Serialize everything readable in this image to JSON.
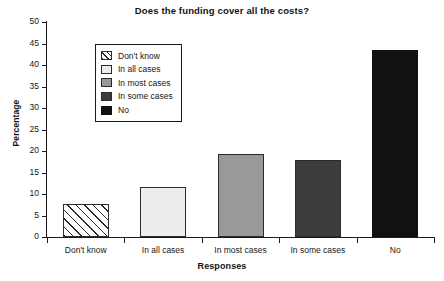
{
  "chart_data": {
    "type": "bar",
    "title": "Does the funding cover all the costs?",
    "xlabel": "Responses",
    "ylabel": "Percentage",
    "categories": [
      "Don't know",
      "In all cases",
      "In most cases",
      "In some cases",
      "No"
    ],
    "values": [
      7.7,
      11.7,
      19.3,
      18.0,
      43.4
    ],
    "ylim": [
      0,
      50
    ],
    "ytick_step": 5,
    "yticks": [
      "0",
      "5",
      "10",
      "15",
      "20",
      "25",
      "30",
      "35",
      "40",
      "45",
      "50"
    ],
    "grid": false,
    "legend_position": "upper-left-inside",
    "series": [
      {
        "name": "Don't know",
        "value": 7.7,
        "fill": "#ffffff",
        "pattern": "diagonal-hatch",
        "edge": "#2b2b2b"
      },
      {
        "name": "In all cases",
        "value": 11.7,
        "fill": "#ededed",
        "pattern": "solid",
        "edge": "#2b2b2b"
      },
      {
        "name": "In most cases",
        "value": 19.3,
        "fill": "#999999",
        "pattern": "solid",
        "edge": "#2b2b2b"
      },
      {
        "name": "In some cases",
        "value": 18.0,
        "fill": "#3d3d3d",
        "pattern": "solid",
        "edge": "#2b2b2b"
      },
      {
        "name": "No",
        "value": 43.4,
        "fill": "#111111",
        "pattern": "solid",
        "edge": "#111111"
      }
    ]
  },
  "legend": {
    "entries": [
      {
        "label": "Don't know"
      },
      {
        "label": "In all cases"
      },
      {
        "label": "In most cases"
      },
      {
        "label": "In some cases"
      },
      {
        "label": "No"
      }
    ]
  }
}
